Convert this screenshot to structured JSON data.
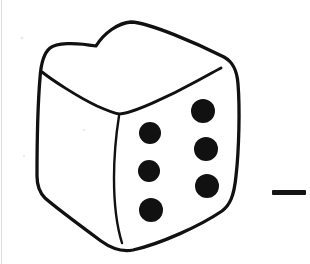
{
  "image": {
    "title": "Hand-drawn die showing six",
    "caption": "Black ink line drawing of a cube-shaped die seen from a three-quarter angle, with six pips visible on the right-hand face",
    "background_color": "#ffffff",
    "ink_color": "#111111",
    "width": 310,
    "height": 264
  },
  "subject": {
    "name": "die",
    "pip_count_visible": 6,
    "visible_faces": [
      "top",
      "front-left",
      "right"
    ],
    "faces": [
      {
        "id": "top",
        "name": "top-face",
        "pips": 0
      },
      {
        "id": "front-left",
        "name": "front-left-face",
        "pips": 0
      },
      {
        "id": "right",
        "name": "right-face",
        "pips": 6
      }
    ]
  },
  "pips": {
    "label": "pips",
    "radius": 11,
    "left_column": [
      {
        "index": 1,
        "cx": 150,
        "cy": 133,
        "r": 11
      },
      {
        "index": 2,
        "cx": 149,
        "cy": 171,
        "r": 11
      },
      {
        "index": 3,
        "cx": 151,
        "cy": 210,
        "r": 12
      }
    ],
    "right_column": [
      {
        "index": 4,
        "cx": 203,
        "cy": 111,
        "r": 12
      },
      {
        "index": 5,
        "cx": 206,
        "cy": 149,
        "r": 12
      },
      {
        "index": 6,
        "cx": 207,
        "cy": 186,
        "r": 12
      }
    ]
  },
  "outline": {
    "name": "die-outline",
    "body_path": "M 96 46 C 104 33 118 23 131 22 C 150 23 196 43 224 57 C 233 62 237 70 238 84 C 240 108 239 150 236 176 C 234 196 230 205 222 211 C 200 226 160 244 133 250 C 122 252 112 249 101 241 C 78 224 55 207 45 198 C 39 192 37 186 37 176 C 37 150 38 102 40 78 C 41 62 44 53 50 48 C 56 43 74 42 96 46 Z",
    "top_face_path": "M 42 72 C 52 80 78 97 97 106 C 106 110 113 113 119 114 C 131 114 170 96 197 81 C 210 74 217 70 221 68",
    "vertical_edge_path": "M 119 116 C 116 135 114 156 114 178 C 114 203 117 227 122 243"
  },
  "marks": {
    "right_dash": {
      "name": "right-edge-dash-mark",
      "x": 272,
      "y": 190,
      "width": 34,
      "height": 5,
      "color": "#141414"
    },
    "scan_left_edge": {
      "name": "scan-edge-line",
      "x": 1.5,
      "color": "#d9dde2"
    },
    "specks": [
      {
        "cx": 22,
        "cy": 38,
        "r": 1.6
      },
      {
        "cx": 84,
        "cy": 130,
        "r": 1.3
      },
      {
        "cx": 24,
        "cy": 156,
        "r": 1.2
      }
    ]
  }
}
